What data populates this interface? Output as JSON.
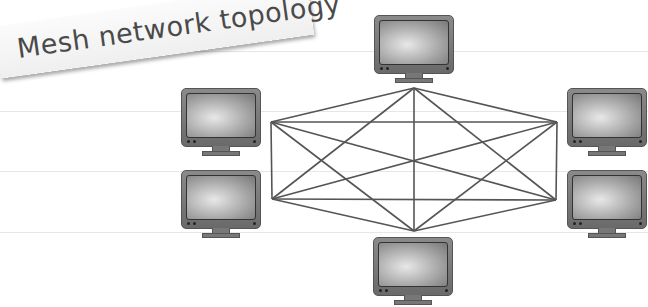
{
  "title": "Mesh network topology",
  "diagram": {
    "type": "full-mesh",
    "node_count": 6,
    "nodes": [
      {
        "id": "top",
        "label": "computer",
        "x": 374,
        "y": 15,
        "port": [
          414,
          88
        ]
      },
      {
        "id": "left-top",
        "label": "computer",
        "x": 181,
        "y": 88,
        "port": [
          271,
          122
        ]
      },
      {
        "id": "left-bottom",
        "label": "computer",
        "x": 181,
        "y": 170,
        "port": [
          272,
          199
        ]
      },
      {
        "id": "right-top",
        "label": "computer",
        "x": 567,
        "y": 88,
        "port": [
          557,
          122
        ]
      },
      {
        "id": "right-bottom",
        "label": "computer",
        "x": 567,
        "y": 170,
        "port": [
          556,
          200
        ]
      },
      {
        "id": "bottom",
        "label": "computer",
        "x": 373,
        "y": 237,
        "port": [
          414,
          231
        ]
      }
    ],
    "edge_count": 15,
    "line_color": "#555555"
  },
  "rules_y": [
    51,
    111,
    171,
    232
  ]
}
